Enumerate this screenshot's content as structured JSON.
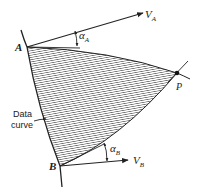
{
  "figure": {
    "points": {
      "A": {
        "label": "A"
      },
      "B": {
        "label": "B"
      },
      "P": {
        "label": "P"
      }
    },
    "vectors": {
      "VA": {
        "label": "V",
        "subscript": "A"
      },
      "VB": {
        "label": "V",
        "subscript": "B"
      }
    },
    "angles": {
      "alphaA": {
        "label": "α",
        "subscript": "A"
      },
      "alphaB": {
        "label": "α",
        "subscript": "B"
      }
    },
    "annotation": {
      "line1": "Data",
      "line2": "curve"
    },
    "colors": {
      "ink": "#222222",
      "hatch": "#555555",
      "background": "#ffffff"
    }
  }
}
